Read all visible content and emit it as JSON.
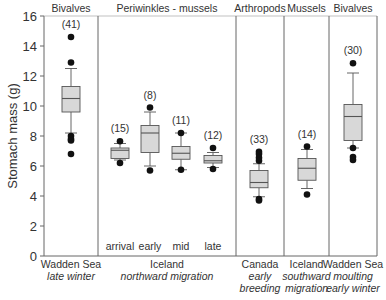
{
  "chart_data": {
    "type": "box",
    "ylabel": "Stomach mass (g)",
    "ylim": [
      0,
      16
    ],
    "yticks": [
      0,
      2,
      4,
      6,
      8,
      10,
      12,
      14,
      16
    ],
    "grid": false,
    "panels": [
      {
        "header": "Bivalves",
        "x0": 44,
        "x1": 98,
        "location": "Wadden Sea",
        "season": [
          "late winter"
        ]
      },
      {
        "header": "Periwinkles - mussels",
        "x0": 98,
        "x1": 236,
        "location": "Iceland",
        "season": [
          "northward migration"
        ]
      },
      {
        "header": "Arthropods",
        "x0": 236,
        "x1": 284,
        "location": "Canada",
        "season": [
          "early",
          "breeding"
        ]
      },
      {
        "header": "Mussels",
        "x0": 284,
        "x1": 329,
        "location": "Iceland",
        "season": [
          "southward",
          "migration"
        ]
      },
      {
        "header": "Bivalves",
        "x0": 329,
        "x1": 377,
        "location": "Wadden Sea",
        "season": [
          "moulting",
          "early winter"
        ]
      }
    ],
    "series": [
      {
        "name": "Wadden Sea late winter",
        "x": 71,
        "n": "(41)",
        "sublabel": "",
        "whisker_low": 8.2,
        "q1": 9.6,
        "median": 10.5,
        "q3": 11.3,
        "whisker_high": 12.5,
        "outliers": [
          14.6,
          12.9,
          8.0,
          7.8,
          7.7,
          6.8
        ]
      },
      {
        "name": "Iceland arrival",
        "x": 120,
        "n": "(15)",
        "sublabel": "arrival",
        "whisker_low": 6.4,
        "q1": 6.5,
        "median": 7.05,
        "q3": 7.2,
        "whisker_high": 7.5,
        "outliers": [
          7.65,
          6.2
        ]
      },
      {
        "name": "Iceland early",
        "x": 150,
        "n": "(8)",
        "sublabel": "early",
        "whisker_low": 6.0,
        "q1": 6.9,
        "median": 8.2,
        "q3": 8.7,
        "whisker_high": 9.6,
        "outliers": [
          9.9,
          5.7
        ]
      },
      {
        "name": "Iceland mid",
        "x": 181,
        "n": "(11)",
        "sublabel": "mid",
        "whisker_low": 5.75,
        "q1": 6.45,
        "median": 6.85,
        "q3": 7.3,
        "whisker_high": 8.2,
        "outliers": [
          8.2,
          5.75
        ]
      },
      {
        "name": "Iceland late",
        "x": 213,
        "n": "(12)",
        "sublabel": "late",
        "whisker_low": 5.9,
        "q1": 6.2,
        "median": 6.35,
        "q3": 6.7,
        "whisker_high": 6.9,
        "outliers": [
          7.2,
          5.8
        ]
      },
      {
        "name": "Canada early breeding",
        "x": 259,
        "n": "(33)",
        "sublabel": "",
        "whisker_low": 3.95,
        "q1": 4.55,
        "median": 4.9,
        "q3": 5.7,
        "whisker_high": 6.15,
        "outliers": [
          6.95,
          6.8,
          6.55,
          6.35,
          3.8,
          3.7
        ]
      },
      {
        "name": "Iceland southward migration",
        "x": 307,
        "n": "(14)",
        "sublabel": "",
        "whisker_low": 4.5,
        "q1": 5.05,
        "median": 5.85,
        "q3": 6.5,
        "whisker_high": 7.1,
        "outliers": [
          7.3,
          4.1
        ]
      },
      {
        "name": "Wadden Sea moulting early winter",
        "x": 353,
        "n": "(30)",
        "sublabel": "",
        "whisker_low": 7.2,
        "q1": 7.7,
        "median": 9.3,
        "q3": 10.1,
        "whisker_high": 12.2,
        "outliers": [
          12.85,
          7.2,
          6.6,
          6.4
        ]
      }
    ],
    "colors": {
      "box_fill": "#d8d8d8",
      "line": "#555555",
      "outlier": "#111111",
      "frame": "#666666"
    }
  }
}
